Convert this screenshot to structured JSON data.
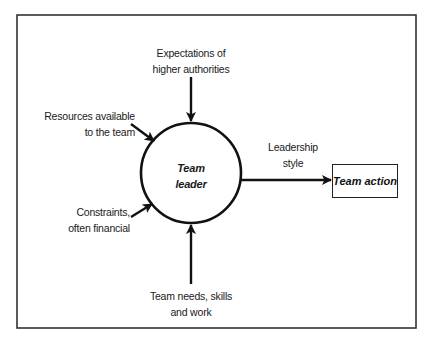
{
  "diagram": {
    "type": "flow",
    "center_node": {
      "label_line1": "Team",
      "label_line2": "leader",
      "shape": "circle"
    },
    "inputs": [
      {
        "id": "expectations",
        "line1": "Expectations of",
        "line2": "higher authorities",
        "direction": "from-top"
      },
      {
        "id": "resources",
        "line1": "Resources available",
        "line2": "to the team",
        "direction": "from-upper-left"
      },
      {
        "id": "constraints",
        "line1": "Constraints,",
        "line2": "often financial",
        "direction": "from-lower-left"
      },
      {
        "id": "team_needs",
        "line1": "Team needs, skills",
        "line2": "and work",
        "direction": "from-bottom"
      }
    ],
    "output_edge": {
      "label_line1": "Leadership",
      "label_line2": "style"
    },
    "output_node": {
      "label": "Team action",
      "shape": "rectangle"
    },
    "colors": {
      "stroke": "#111111",
      "frame": "#333333",
      "background": "#ffffff"
    }
  }
}
